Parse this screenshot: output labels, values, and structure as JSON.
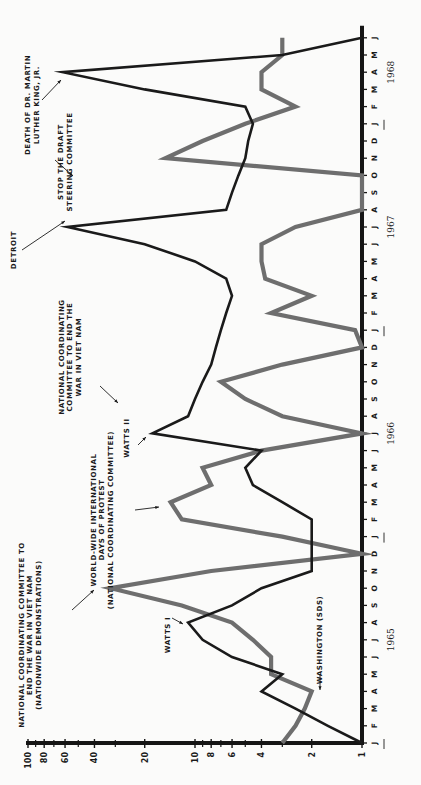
{
  "chart_data": {
    "type": "line",
    "orientation": "rotated-90-ccw",
    "title": "",
    "xlabel": "",
    "ylabel": "",
    "y_scale": "log",
    "ylim": [
      1,
      100
    ],
    "y_ticks": [
      1,
      2,
      4,
      6,
      8,
      10,
      20,
      40,
      60,
      80,
      100
    ],
    "y_tick_labels": [
      "1",
      "2",
      "4",
      "6",
      "8",
      "10",
      "20",
      "40",
      "60",
      "80",
      "100"
    ],
    "x_month_labels": [
      "J",
      "F",
      "M",
      "A",
      "M",
      "J",
      "J",
      "A",
      "S",
      "O",
      "N",
      "D",
      "J",
      "F",
      "M",
      "A",
      "M",
      "J",
      "J",
      "A",
      "S",
      "O",
      "N",
      "D",
      "J",
      "F",
      "M",
      "A",
      "M",
      "J",
      "J",
      "A",
      "S",
      "O",
      "N",
      "D",
      "J",
      "F",
      "M",
      "A",
      "M",
      "J"
    ],
    "year_labels": [
      {
        "label": "1965",
        "month_index": 6
      },
      {
        "label": "1966",
        "month_index": 18
      },
      {
        "label": "1967",
        "month_index": 30
      },
      {
        "label": "1968",
        "month_index": 39
      }
    ],
    "x": [
      0,
      1,
      2,
      3,
      4,
      5,
      6,
      7,
      8,
      9,
      10,
      11,
      12,
      13,
      14,
      15,
      16,
      17,
      18,
      19,
      20,
      21,
      22,
      23,
      24,
      25,
      26,
      27,
      28,
      29,
      30,
      31,
      32,
      33,
      34,
      35,
      36,
      37,
      38,
      39,
      40,
      41
    ],
    "series": [
      {
        "name": "Riots (black line)",
        "color": "#1a1a1a",
        "values": [
          1,
          1.6,
          2.5,
          4,
          3,
          6,
          9,
          11,
          6,
          4,
          2,
          2,
          2,
          2,
          3,
          4.5,
          5,
          4,
          18,
          11,
          10,
          9,
          8,
          7.5,
          7,
          6.5,
          6,
          6.5,
          10,
          20,
          58,
          6.5,
          6,
          5.5,
          5,
          4.8,
          4.5,
          5,
          20,
          62,
          3,
          1
        ]
      },
      {
        "name": "Antiwar demonstrations (gray line)",
        "color": "#6e6e6e",
        "values": [
          3,
          2.5,
          2.2,
          2,
          3.5,
          3.5,
          4.5,
          6,
          12,
          32,
          8,
          1,
          3,
          12,
          14,
          8,
          9,
          4,
          1,
          3,
          5,
          7,
          3,
          1,
          1.1,
          3.5,
          2,
          3.8,
          4,
          4,
          2.5,
          1,
          1,
          1,
          15,
          9,
          5,
          2.5,
          4,
          4,
          3,
          3
        ]
      }
    ],
    "annotations": [
      {
        "text": "DEATH OF DR. MARTIN LUTHER KING, JR.",
        "series": "Riots (black line)",
        "month_index": 39
      },
      {
        "text": "STOP THE DRAFT STEERING COMMITTEE",
        "series": "Antiwar demonstrations (gray line)",
        "month_index": 33
      },
      {
        "text": "DETROIT",
        "series": "Riots (black line)",
        "month_index": 30
      },
      {
        "text": "NATIONAL COORDINATING COMMITTEE TO END THE WAR IN VIET NAM",
        "series": "Antiwar demonstrations (gray line)",
        "month_index": 21
      },
      {
        "text": "WATTS II",
        "series": "Riots (black line)",
        "month_index": 18
      },
      {
        "text": "WORLD-WIDE INTERNATIONAL DAYS OF PROTEST (NATIONAL COORDINATING COMMITTEE)",
        "series": "Antiwar demonstrations (gray line)",
        "month_index": 14
      },
      {
        "text": "NATIONAL COORDINATING COMMITTEE TO END THE WAR IN VIET NAM (NATIONWIDE DEMONSTRATIONS)",
        "series": "Antiwar demonstrations (gray line)",
        "month_index": 9
      },
      {
        "text": "WATTS I",
        "series": "Riots (black line)",
        "month_index": 7
      },
      {
        "text": "WASHINGTON (SDS)",
        "series": "Antiwar demonstrations (gray line)",
        "month_index": 3
      }
    ],
    "grid": false,
    "legend": null
  },
  "labels": {
    "mlk": [
      "DEATH OF DR. MARTIN",
      "LUTHER KING, JR."
    ],
    "stop_draft": [
      "STOP THE DRAFT",
      "STEERING COMMITTEE"
    ],
    "detroit": [
      "DETROIT"
    ],
    "ncc_1966": [
      "NATIONAL COORDINATING",
      "COMMITTEE TO END THE",
      "WAR IN VIET NAM"
    ],
    "watts2": [
      "WATTS II"
    ],
    "worldwide": [
      "WORLD-WIDE INTERNATIONAL",
      "DAYS OF PROTEST",
      "(NATIONAL COORDINATING COMMITTEE)"
    ],
    "ncc_1965": [
      "NATIONAL COORDINATING COMMITTEE TO",
      "END THE WAR IN VIET NAM",
      "(NATIONWIDE DEMONSTRATIONS)"
    ],
    "watts1": [
      "WATTS I"
    ],
    "washington": [
      "WASHINGTON (SDS)"
    ]
  }
}
